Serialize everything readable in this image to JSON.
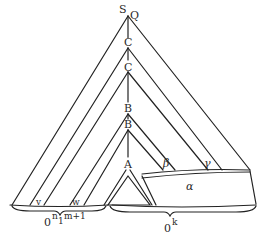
{
  "diagram": {
    "type": "derivation-tree",
    "nodes": {
      "root_s": "S",
      "root_q": "Q",
      "c1": "C",
      "c2": "C",
      "b1": "B",
      "b2": "B",
      "a": "A"
    },
    "subtree_labels": {
      "beta": "β",
      "gamma": "γ",
      "alpha": "α",
      "v": "v",
      "w": "w"
    },
    "brackets": {
      "left": {
        "base": "0",
        "sup1": "n",
        "sub": "1",
        "sup2": "m+1"
      },
      "right": {
        "base": "0",
        "sup": "k"
      }
    },
    "colors": {
      "ink": "#222222",
      "background": "#ffffff"
    }
  }
}
